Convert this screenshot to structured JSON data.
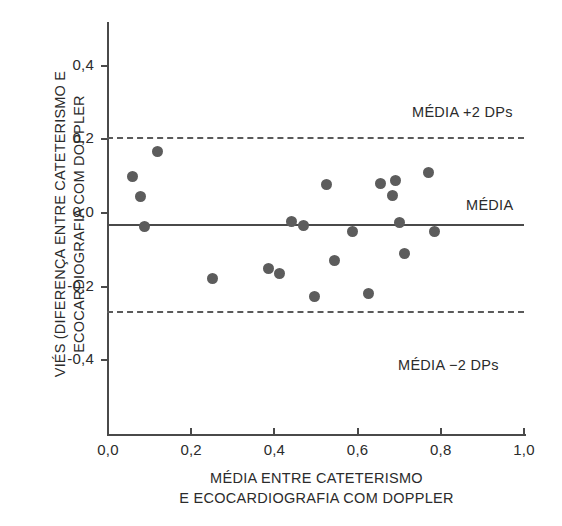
{
  "chart_data": {
    "type": "scatter",
    "title": "",
    "xlabel_lines": [
      "MÉDIA ENTRE CATETERISMO",
      "E ECOCARDIOGRAFIA COM DOPPLER"
    ],
    "ylabel_lines": [
      "VIÉS (DIFERENÇA ENTRE CATETERISMO E",
      "ECOCARDIOGRAFIA COM DOPPLER"
    ],
    "xlim": [
      0.0,
      1.0
    ],
    "ylim": [
      -0.5,
      0.45
    ],
    "grid": false,
    "legend_position": "inside-right",
    "xticks": [
      0.0,
      0.2,
      0.4,
      0.6,
      0.8,
      1.0
    ],
    "xticklabels": [
      "0,0",
      "0,2",
      "0,4",
      "0,6",
      "0,8",
      "1,0"
    ],
    "yticks": [
      0.4,
      0.2,
      0.0,
      -0.2,
      -0.4
    ],
    "yticklabels": [
      "0,4",
      "0,2",
      "0,0",
      "-0,2",
      "-0,4"
    ],
    "reference_lines": [
      {
        "name": "upper-limit",
        "label": "MÉDIA +2 DPs",
        "value": 0.205,
        "style": "dashed"
      },
      {
        "name": "mean",
        "label": "MÉDIA",
        "value": -0.033,
        "style": "solid"
      },
      {
        "name": "lower-limit",
        "label": "MÉDIA −2 DPs",
        "value": -0.268,
        "style": "dashed"
      }
    ],
    "series": [
      {
        "name": "bias",
        "color": "#5c5c5c",
        "marker": "circle",
        "points": [
          {
            "x": 0.06,
            "y": 0.1
          },
          {
            "x": 0.078,
            "y": 0.045
          },
          {
            "x": 0.088,
            "y": -0.037
          },
          {
            "x": 0.118,
            "y": 0.168
          },
          {
            "x": 0.25,
            "y": -0.178
          },
          {
            "x": 0.385,
            "y": -0.152
          },
          {
            "x": 0.413,
            "y": -0.165
          },
          {
            "x": 0.44,
            "y": -0.022
          },
          {
            "x": 0.47,
            "y": -0.033
          },
          {
            "x": 0.497,
            "y": -0.228
          },
          {
            "x": 0.525,
            "y": 0.078
          },
          {
            "x": 0.545,
            "y": -0.128
          },
          {
            "x": 0.588,
            "y": -0.05
          },
          {
            "x": 0.627,
            "y": -0.22
          },
          {
            "x": 0.655,
            "y": 0.08
          },
          {
            "x": 0.69,
            "y": 0.088
          },
          {
            "x": 0.683,
            "y": 0.048
          },
          {
            "x": 0.7,
            "y": -0.025
          },
          {
            "x": 0.713,
            "y": -0.11
          },
          {
            "x": 0.77,
            "y": 0.11
          },
          {
            "x": 0.785,
            "y": -0.05
          }
        ]
      }
    ]
  },
  "axis_geometry": {
    "x_pixel_at_0": 108,
    "x_pixel_at_1": 524,
    "y_pixel_at_0": 213,
    "y_pixels_per_unit": 368
  }
}
